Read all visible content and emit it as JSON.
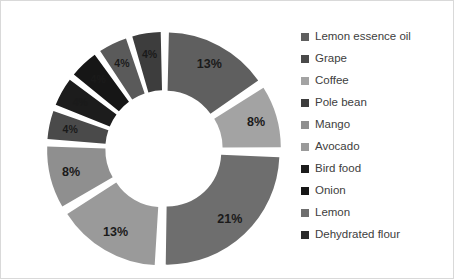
{
  "chart_data": {
    "type": "pie",
    "variant": "doughnut-exploded",
    "title": "",
    "subtitle": "",
    "xlabel": "",
    "ylabel": "",
    "grid": false,
    "legend_position": "right",
    "value_unit": "percent",
    "start_angle_deg": 0,
    "direction": "clockwise",
    "hole_ratio": 0.48,
    "categories": [
      "Lemon essence oil",
      "Grape",
      "Coffee",
      "Pole bean",
      "Mango",
      "Avocado",
      "Bird food",
      "Onion",
      "Lemon",
      "Dehydrated flour"
    ],
    "values": [
      13,
      8,
      21,
      13,
      8,
      4,
      4,
      4,
      4,
      4
    ],
    "data_labels": [
      "13%",
      "8%",
      "21%",
      "13%",
      "8%",
      "4%",
      "4%",
      "4%",
      "4%",
      "4%"
    ],
    "colors": [
      "#5f5f5f",
      "#a3a3a3",
      "#6e6e6e",
      "#9a9a9a",
      "#8f8f8f",
      "#4a4a4a",
      "#1c1c1c",
      "#161616",
      "#5a5a5a",
      "#3d3d3d"
    ],
    "legend_swatch_colors": [
      "#5f5f5f",
      "#4a4a4a",
      "#a3a3a3",
      "#3d3d3d",
      "#8f8f8f",
      "#9a9a9a",
      "#1c1c1c",
      "#161616",
      "#6e6e6e",
      "#2a2a2a"
    ]
  },
  "legend": {
    "items": [
      {
        "label": "Lemon essence oil"
      },
      {
        "label": "Grape"
      },
      {
        "label": "Coffee"
      },
      {
        "label": "Pole bean"
      },
      {
        "label": "Mango"
      },
      {
        "label": "Avocado"
      },
      {
        "label": "Bird food"
      },
      {
        "label": "Onion"
      },
      {
        "label": "Lemon"
      },
      {
        "label": "Dehydrated flour"
      }
    ]
  },
  "frame": {
    "border_color": "#d9d9d9",
    "background": "#ffffff"
  }
}
